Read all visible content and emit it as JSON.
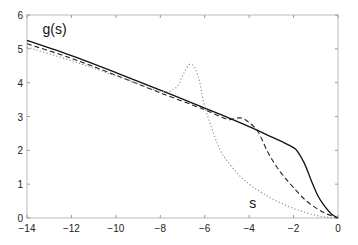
{
  "chart_data": {
    "type": "line",
    "title": "",
    "xlabel": "",
    "ylabel": "",
    "xlim": [
      -14,
      0
    ],
    "ylim": [
      0,
      6
    ],
    "grid": false,
    "x_ticks": [
      -14,
      -12,
      -10,
      -8,
      -6,
      -4,
      -2,
      0
    ],
    "y_ticks": [
      0,
      1,
      2,
      3,
      4,
      5,
      6
    ],
    "annotations": [
      {
        "text": "g(s)",
        "x": -13.3,
        "y": 5.45
      },
      {
        "text": "s",
        "x": -4.0,
        "y": 0.3
      }
    ],
    "series": [
      {
        "name": "solid",
        "style": "solid",
        "x": [
          -14,
          -12,
          -10,
          -8,
          -6,
          -5,
          -4,
          -3,
          -2.5,
          -2,
          -1.8,
          -1.5,
          -1.2,
          -0.9,
          -0.6,
          -0.3,
          0
        ],
        "y": [
          5.25,
          4.8,
          4.3,
          3.78,
          3.25,
          2.98,
          2.7,
          2.4,
          2.25,
          2.08,
          1.95,
          1.6,
          1.1,
          0.65,
          0.35,
          0.12,
          0
        ]
      },
      {
        "name": "dashed",
        "style": "dashed",
        "x": [
          -14,
          -12,
          -10,
          -8,
          -6,
          -5,
          -4.6,
          -4.3,
          -4.0,
          -3.6,
          -3.2,
          -2.8,
          -2.4,
          -2,
          -1.5,
          -1,
          -0.5,
          0
        ],
        "y": [
          5.15,
          4.72,
          4.22,
          3.7,
          3.2,
          2.92,
          2.95,
          2.95,
          2.82,
          2.55,
          2.0,
          1.55,
          1.2,
          0.9,
          0.55,
          0.3,
          0.12,
          0
        ]
      },
      {
        "name": "dotted",
        "style": "dotted",
        "x": [
          -14,
          -12,
          -10,
          -8,
          -7.3,
          -7.0,
          -6.65,
          -6.3,
          -6.0,
          -5.6,
          -5.3,
          -5.0,
          -4.5,
          -4,
          -3.5,
          -3,
          -2.5,
          -2,
          -1.5,
          -1,
          -0.5,
          0
        ],
        "y": [
          5.05,
          4.65,
          4.2,
          3.75,
          3.85,
          4.2,
          4.55,
          4.2,
          3.3,
          2.5,
          2.0,
          1.7,
          1.3,
          1.0,
          0.78,
          0.58,
          0.42,
          0.28,
          0.17,
          0.08,
          0.02,
          0
        ]
      }
    ]
  }
}
